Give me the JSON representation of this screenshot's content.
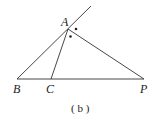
{
  "diagram": {
    "caption": "( b )",
    "points": {
      "A": {
        "label": "A",
        "x": 68,
        "y": 29
      },
      "B": {
        "label": "B",
        "x": 17,
        "y": 79
      },
      "C": {
        "label": "C",
        "x": 51,
        "y": 79
      },
      "P": {
        "label": "P",
        "x": 144,
        "y": 79
      }
    },
    "extension_end": {
      "x": 91,
      "y": 6
    },
    "angle_marks": [
      "dot",
      "dot"
    ],
    "stroke_color": "#333333"
  }
}
